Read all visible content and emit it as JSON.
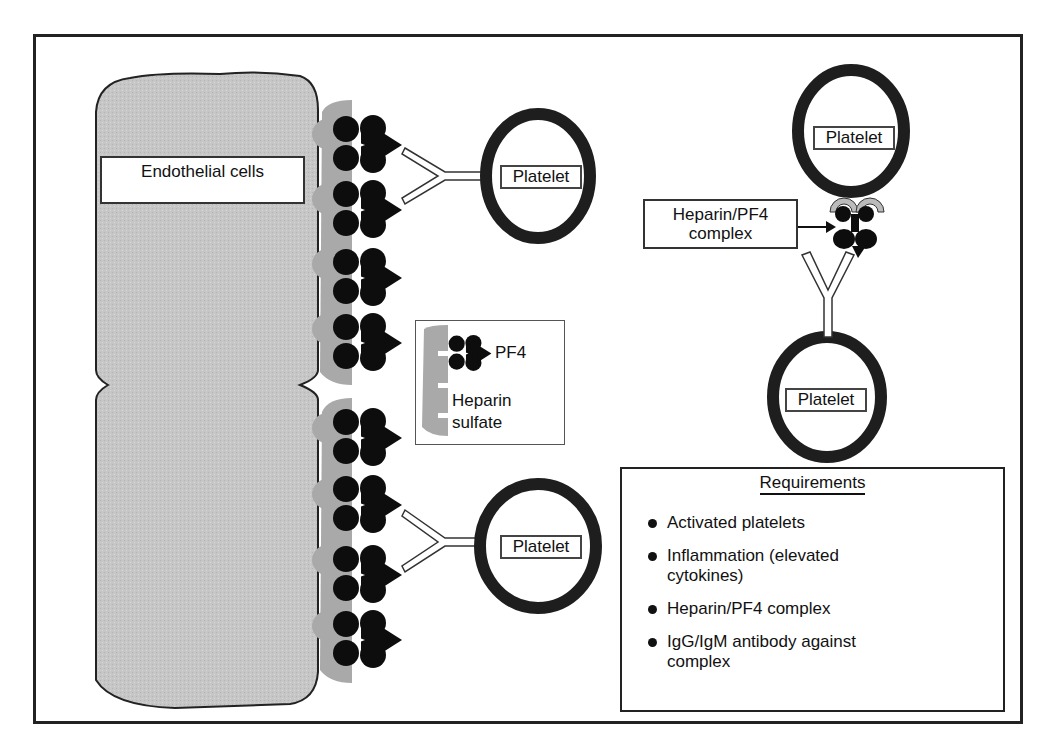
{
  "diagram": {
    "endothelial_label": "Endothelial cells",
    "platelets": [
      {
        "id": "upper-left",
        "label": "Platelet"
      },
      {
        "id": "lower-left",
        "label": "Platelet"
      },
      {
        "id": "top-right",
        "label": "Platelet"
      },
      {
        "id": "bottom-right",
        "label": "Platelet"
      }
    ],
    "legend_inset": {
      "pf4_label": "PF4",
      "heparin_label_line1": "Heparin",
      "heparin_label_line2": "sulfate"
    },
    "complex_callout": {
      "line1": "Heparin/PF4",
      "line2": "complex"
    },
    "requirements": {
      "title": "Requirements",
      "items": [
        "Activated platelets",
        "Inflammation (elevated cytokines)",
        "Heparin/PF4 complex",
        "IgG/IgM antibody against complex"
      ]
    },
    "colors": {
      "endothelium_fill": "#c8c8c8",
      "heparin_sulfate": "#a9a9a9",
      "pf4": "#0d0d0d",
      "platelet_ring": "#1e1e1e",
      "frame": "#222222"
    }
  }
}
